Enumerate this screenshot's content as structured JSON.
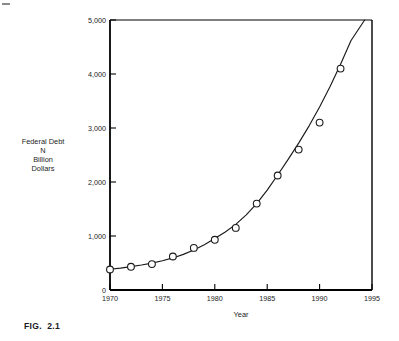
{
  "figure": {
    "caption": "FIG.  2.1"
  },
  "chart_data": {
    "type": "scatter",
    "title": "",
    "subtitle": "",
    "xlabel": "Year",
    "ylabel": "Federal Debt\nN\nBillion\nDollars",
    "ylabel_lines": [
      "Federal Debt",
      "N",
      "Billion",
      "Dollars"
    ],
    "x": [
      1970,
      1972,
      1974,
      1976,
      1978,
      1980,
      1982,
      1984,
      1986,
      1988,
      1990,
      1992
    ],
    "values": [
      380,
      430,
      480,
      620,
      780,
      930,
      1150,
      1600,
      2120,
      2600,
      3100,
      4100
    ],
    "series": [
      {
        "name": "Federal Debt",
        "x": [
          1970,
          1972,
          1974,
          1976,
          1978,
          1980,
          1982,
          1984,
          1986,
          1988,
          1990,
          1992
        ],
        "values": [
          380,
          430,
          480,
          620,
          780,
          930,
          1150,
          1600,
          2120,
          2600,
          3100,
          4100
        ]
      }
    ],
    "fitted_curve": {
      "name": "exponential trend",
      "x": [
        1970,
        1971,
        1972,
        1973,
        1974,
        1975,
        1976,
        1977,
        1978,
        1979,
        1980,
        1981,
        1982,
        1983,
        1984,
        1985,
        1986,
        1987,
        1988,
        1989,
        1990,
        1991,
        1992,
        1993,
        1994.3
      ],
      "values": [
        385,
        405,
        432,
        462,
        497,
        541,
        594,
        660,
        742,
        840,
        952,
        1075,
        1215,
        1390,
        1600,
        1850,
        2130,
        2420,
        2720,
        3040,
        3390,
        3770,
        4180,
        4620,
        5000
      ]
    },
    "xlim": [
      1970,
      1995
    ],
    "ylim": [
      0,
      5000
    ],
    "xticks": [
      1970,
      1975,
      1980,
      1985,
      1990,
      1995
    ],
    "xtick_labels": [
      "1970",
      "1975",
      "1980",
      "1985",
      "1990",
      "1995"
    ],
    "yticks": [
      0,
      1000,
      2000,
      3000,
      4000,
      5000
    ],
    "ytick_labels": [
      "0",
      "1,000",
      "2,000",
      "3,000",
      "4,000",
      "5,000"
    ],
    "grid": false,
    "legend": "none",
    "marker": "open-circle",
    "line_color": "#1a1a1a",
    "marker_color": "#ffffff",
    "marker_edge_color": "#1a1a1a",
    "axis_color": "#000000",
    "background_color": "#ffffff"
  }
}
